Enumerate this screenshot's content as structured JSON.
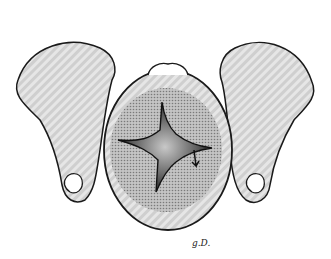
{
  "illustration": {
    "subject": "two hands holding an infant head viewed from above with stellate (cruciate) opening in the shaded scalp/fontanelle region",
    "signature": "g.D.",
    "colors": {
      "outline": "#1a1a1a",
      "skin_fill": "#d8d8d8",
      "stipple": "#9a9a9a",
      "opening_dark": "#2a2a2a",
      "opening_center": "#b0b0b0",
      "background": "#ffffff"
    }
  }
}
